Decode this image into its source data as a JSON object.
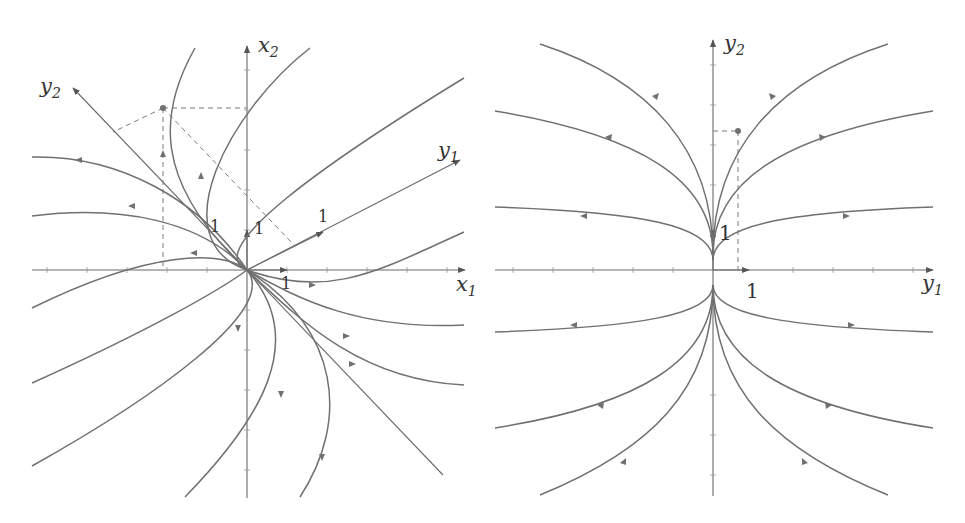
{
  "left_plot": {
    "axes": {
      "x_label": "x",
      "x_sub": "1",
      "y_label": "x",
      "y_sub": "2"
    },
    "eigen_axes": {
      "u_label": "y",
      "u_sub": "1",
      "v_label": "y",
      "v_sub": "2"
    },
    "unit_labels": {
      "x": "1",
      "y": "1",
      "u": "1",
      "v": "1"
    }
  },
  "right_plot": {
    "axes": {
      "x_label": "y",
      "x_sub": "1",
      "y_label": "y",
      "y_sub": "2"
    },
    "unit_labels": {
      "x": "1",
      "y": "1"
    }
  },
  "colors": {
    "curve": "#707070",
    "axis": "#6a6a6a",
    "text": "#333333"
  }
}
